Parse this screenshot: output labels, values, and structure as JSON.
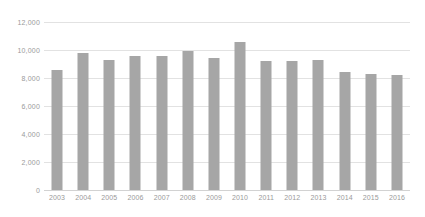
{
  "chart_data": {
    "type": "bar",
    "title": "",
    "subtitle": "",
    "xlabel": "",
    "ylabel": "",
    "categories": [
      "2003",
      "2004",
      "2005",
      "2006",
      "2007",
      "2008",
      "2009",
      "2010",
      "2011",
      "2012",
      "2013",
      "2014",
      "2015",
      "2016"
    ],
    "values": [
      8600,
      9800,
      9300,
      9600,
      9600,
      9900,
      9450,
      10550,
      9250,
      9200,
      9300,
      8450,
      8300,
      8250
    ],
    "series": [
      {
        "name": "",
        "values": [
          8600,
          9800,
          9300,
          9600,
          9600,
          9900,
          9450,
          10550,
          9250,
          9200,
          9300,
          8450,
          8300,
          8250
        ]
      }
    ],
    "ylim": [
      0,
      12000
    ],
    "yticks": [
      0,
      2000,
      4000,
      6000,
      8000,
      10000,
      12000
    ],
    "ytick_labels": [
      "0",
      "2,000",
      "4,000",
      "6,000",
      "8,000",
      "10,000",
      "12,000"
    ],
    "grid": true,
    "grid_axis": "y",
    "legend": false,
    "legend_position": "none",
    "bar_color": "#a6a6a6",
    "gridline_color": "#e2e2e2",
    "axis_color": "#d2d2d2",
    "tick_label_color": "#9a9a9a",
    "background_color": "#ffffff"
  }
}
